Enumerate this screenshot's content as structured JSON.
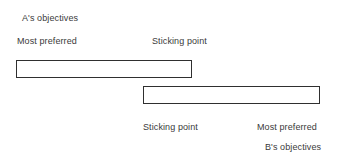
{
  "diagram": {
    "title_a": "A's objectives",
    "title_b": "B's objectives",
    "party_a": {
      "most_preferred_label": "Most preferred",
      "sticking_point_label": "Sticking point"
    },
    "party_b": {
      "sticking_point_label": "Sticking point",
      "most_preferred_label": "Most preferred"
    },
    "colors": {
      "background": "#ffffff",
      "text": "#3a3a3a",
      "bar_border": "#2f2f2f",
      "bar_fill": "#ffffff"
    }
  }
}
